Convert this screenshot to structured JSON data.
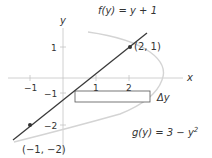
{
  "figure": {
    "f_label": "f(y) = y + 1",
    "g_label": "g(y) = 3 − y²",
    "g_label_base": "g(y) = 3 − y",
    "g_label_exp": "2",
    "axis_x_label": "x",
    "axis_y_label": "y",
    "tick_x": [
      "−1",
      "1",
      "2"
    ],
    "tick_y": [
      "1",
      "−1",
      "−2"
    ],
    "point_upper": "(2, 1)",
    "point_lower": "(−1, −2)",
    "delta_label": "Δy",
    "colors": {
      "line": "#3a3a3a",
      "parabola": "#cfcfcf",
      "axis": "#bbbbbb",
      "point": "#333333",
      "rect": "#555555"
    }
  }
}
